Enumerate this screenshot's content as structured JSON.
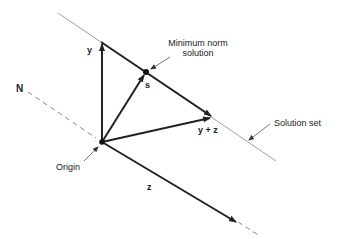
{
  "diagram": {
    "labels": {
      "y": "y",
      "s": "s",
      "y_plus_z": "y + z",
      "z": "z",
      "N": "N",
      "origin": "Origin",
      "minimum_norm_line1": "Minimum norm",
      "minimum_norm_line2": "solution",
      "solution_set": "Solution set"
    },
    "colors": {
      "vector": "#222222",
      "thin_line": "#888888",
      "dashed": "#777777",
      "text": "#222222"
    }
  }
}
